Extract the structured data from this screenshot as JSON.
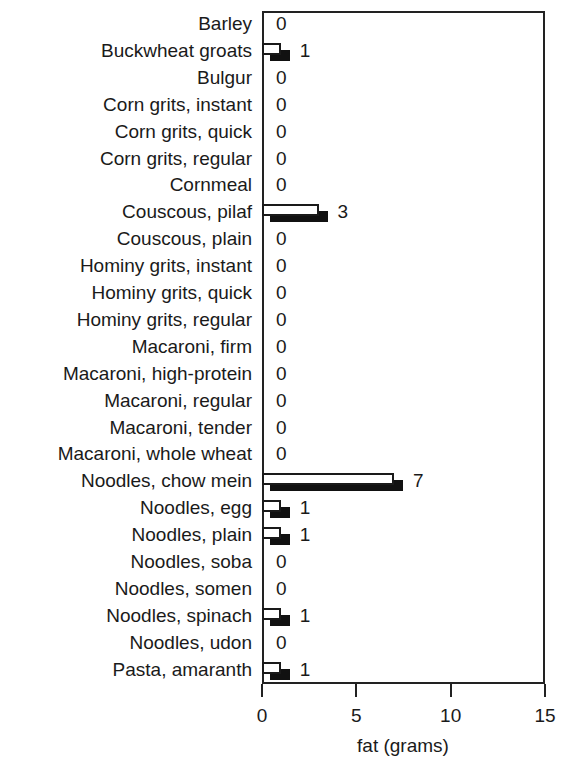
{
  "chart_data": {
    "type": "bar",
    "orientation": "horizontal",
    "title": "",
    "xlabel": "fat (grams)",
    "ylabel": "",
    "xlim": [
      0,
      15
    ],
    "xticks": [
      0,
      5,
      10,
      15
    ],
    "grid": false,
    "legend": null,
    "style_note": "each value drawn as white outlined bar with offset black shadow bar",
    "categories": [
      "Barley",
      "Buckwheat groats",
      "Bulgur",
      "Corn grits, instant",
      "Corn grits, quick",
      "Corn grits, regular",
      "Cornmeal",
      "Couscous, pilaf",
      "Couscous, plain",
      "Hominy grits, instant",
      "Hominy grits, quick",
      "Hominy grits, regular",
      "Macaroni, firm",
      "Macaroni, high-protein",
      "Macaroni, regular",
      "Macaroni, tender",
      "Macaroni, whole wheat",
      "Noodles, chow mein",
      "Noodles, egg",
      "Noodles, plain",
      "Noodles, soba",
      "Noodles, somen",
      "Noodles, spinach",
      "Noodles, udon",
      "Pasta, amaranth"
    ],
    "values": [
      0,
      1,
      0,
      0,
      0,
      0,
      0,
      3,
      0,
      0,
      0,
      0,
      0,
      0,
      0,
      0,
      0,
      7,
      1,
      1,
      0,
      0,
      1,
      0,
      1
    ],
    "value_labels": [
      "0",
      "1",
      "0",
      "0",
      "0",
      "0",
      "0",
      "3",
      "0",
      "0",
      "0",
      "0",
      "0",
      "0",
      "0",
      "0",
      "0",
      "7",
      "1",
      "1",
      "0",
      "0",
      "1",
      "0",
      "1"
    ]
  },
  "colors": {
    "bar_fill": "#ffffff",
    "bar_shadow": "#111111",
    "axis": "#222222",
    "text": "#1a1a1a"
  }
}
